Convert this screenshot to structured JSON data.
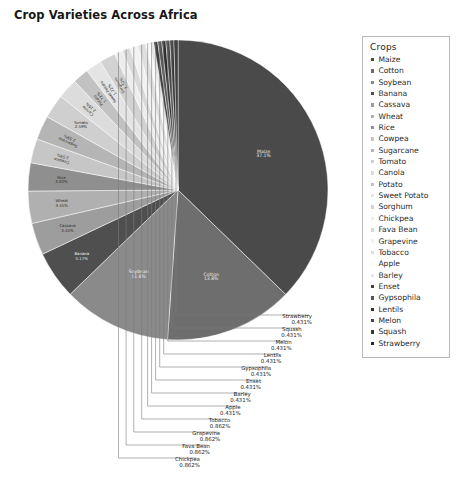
{
  "chart_title": "Crop Varieties Across Africa",
  "legend": {
    "title": "Crops",
    "items": [
      {
        "label": "Maize",
        "color": "#4a4a4a"
      },
      {
        "label": "Cotton",
        "color": "#6e6e6e"
      },
      {
        "label": "Soybean",
        "color": "#8a8a8a"
      },
      {
        "label": "Banana",
        "color": "#4f4f4f"
      },
      {
        "label": "Cassava",
        "color": "#9d9d9d"
      },
      {
        "label": "Wheat",
        "color": "#b0b0b0"
      },
      {
        "label": "Rice",
        "color": "#8f8f8f"
      },
      {
        "label": "Cowpea",
        "color": "#c6c6c6"
      },
      {
        "label": "Sugarcane",
        "color": "#b5b5b5"
      },
      {
        "label": "Tomato",
        "color": "#cfcfcf"
      },
      {
        "label": "Canola",
        "color": "#dcdcdc"
      },
      {
        "label": "Potato",
        "color": "#c2c2c2"
      },
      {
        "label": "Sweet Potato",
        "color": "#e4e4e4"
      },
      {
        "label": "Sorghum",
        "color": "#d2d2d2"
      },
      {
        "label": "Chickpea",
        "color": "#ededed"
      },
      {
        "label": "Fava Bean",
        "color": "#dadada"
      },
      {
        "label": "Grapevine",
        "color": "#f2f2f2"
      },
      {
        "label": "Tobacco",
        "color": "#e0e0e0"
      },
      {
        "label": "Apple",
        "color": "#fafafa"
      },
      {
        "label": "Barley",
        "color": "#e8e8e8"
      },
      {
        "label": "Enset",
        "color": "#3f3f3f"
      },
      {
        "label": "Gypsophila",
        "color": "#565656"
      },
      {
        "label": "Lentils",
        "color": "#2e2e2e"
      },
      {
        "label": "Melon",
        "color": "#474747"
      },
      {
        "label": "Squash",
        "color": "#383838"
      },
      {
        "label": "Strawberry",
        "color": "#282828"
      }
    ]
  },
  "chart_data": {
    "type": "pie",
    "title": "Crop Varieties Across Africa",
    "legend_position": "right",
    "legend_title": "Crops",
    "units": "percent",
    "start_angle_deg": 0,
    "direction": "clockwise",
    "categories": [
      "Maize",
      "Cotton",
      "Soybean",
      "Banana",
      "Cassava",
      "Wheat",
      "Rice",
      "Cowpea",
      "Sugarcane",
      "Tomato",
      "Canola",
      "Potato",
      "Sweet Potato",
      "Sorghum",
      "Chickpea",
      "Fava Bean",
      "Grapevine",
      "Tobacco",
      "Apple",
      "Barley",
      "Enset",
      "Gypsophila",
      "Lentils",
      "Melon",
      "Squash",
      "Strawberry"
    ],
    "values": [
      37.1,
      13.8,
      11.6,
      5.17,
      3.45,
      3.45,
      3.02,
      2.59,
      2.59,
      2.59,
      2.16,
      1.72,
      1.72,
      1.72,
      0.862,
      0.862,
      0.862,
      0.862,
      0.431,
      0.431,
      0.431,
      0.431,
      0.431,
      0.431,
      0.431,
      0.431
    ],
    "slices": [
      {
        "name": "Maize",
        "value": 37.1,
        "label": "Maize",
        "pct_label": "37.1%",
        "color": "#4a4a4a",
        "label_mode": "inside"
      },
      {
        "name": "Cotton",
        "value": 13.8,
        "label": "Cotton",
        "pct_label": "13.8%",
        "color": "#6e6e6e",
        "label_mode": "inside"
      },
      {
        "name": "Soybean",
        "value": 11.6,
        "label": "Soybean",
        "pct_label": "11.6%",
        "color": "#8a8a8a",
        "label_mode": "inside"
      },
      {
        "name": "Banana",
        "value": 5.17,
        "label": "Banana",
        "pct_label": "5.17%",
        "color": "#4f4f4f",
        "label_mode": "inside"
      },
      {
        "name": "Cassava",
        "value": 3.45,
        "label": "Cassava",
        "pct_label": "3.45%",
        "color": "#9d9d9d",
        "label_mode": "inside"
      },
      {
        "name": "Wheat",
        "value": 3.45,
        "label": "Wheat",
        "pct_label": "3.45%",
        "color": "#b0b0b0",
        "label_mode": "inside"
      },
      {
        "name": "Rice",
        "value": 3.02,
        "label": "Rice",
        "pct_label": "3.02%",
        "color": "#8f8f8f",
        "label_mode": "inside"
      },
      {
        "name": "Cowpea",
        "value": 2.59,
        "label": "Cowpea",
        "pct_label": "2.59%",
        "color": "#c6c6c6",
        "label_mode": "inside-rotated"
      },
      {
        "name": "Sugarcane",
        "value": 2.59,
        "label": "Sugarcane",
        "pct_label": "2.59%",
        "color": "#b5b5b5",
        "label_mode": "inside-rotated"
      },
      {
        "name": "Tomato",
        "value": 2.59,
        "label": "Tomato",
        "pct_label": "2.59%",
        "color": "#cfcfcf",
        "label_mode": "inside"
      },
      {
        "name": "Canola",
        "value": 2.16,
        "label": "Canola",
        "pct_label": "2.16%",
        "color": "#dcdcdc",
        "label_mode": "inside-rotated"
      },
      {
        "name": "Potato",
        "value": 1.72,
        "label": "Potato",
        "pct_label": "1.72%",
        "color": "#c2c2c2",
        "label_mode": "inside-rotated"
      },
      {
        "name": "Sweet Potato",
        "value": 1.72,
        "label": "Sweet Potato",
        "pct_label": "1.72%",
        "color": "#e4e4e4",
        "label_mode": "inside-rotated"
      },
      {
        "name": "Sorghum",
        "value": 1.72,
        "label": "Sorghum",
        "pct_label": "1.72%",
        "color": "#d2d2d2",
        "label_mode": "inside-rotated"
      },
      {
        "name": "Chickpea",
        "value": 0.862,
        "label": "Chickpea",
        "pct_label": "0.862%",
        "color": "#ededed",
        "label_mode": "callout"
      },
      {
        "name": "Fava Bean",
        "value": 0.862,
        "label": "Fava Bean",
        "pct_label": "0.862%",
        "color": "#dadada",
        "label_mode": "callout"
      },
      {
        "name": "Grapevine",
        "value": 0.862,
        "label": "Grapevine",
        "pct_label": "0.862%",
        "color": "#f2f2f2",
        "label_mode": "callout"
      },
      {
        "name": "Tobacco",
        "value": 0.862,
        "label": "Tobacco",
        "pct_label": "0.862%",
        "color": "#e0e0e0",
        "label_mode": "callout"
      },
      {
        "name": "Apple",
        "value": 0.431,
        "label": "Apple",
        "pct_label": "0.431%",
        "color": "#fafafa",
        "label_mode": "callout"
      },
      {
        "name": "Barley",
        "value": 0.431,
        "label": "Barley",
        "pct_label": "0.431%",
        "color": "#e8e8e8",
        "label_mode": "callout"
      },
      {
        "name": "Enset",
        "value": 0.431,
        "label": "Enset",
        "pct_label": "0.431%",
        "color": "#3f3f3f",
        "label_mode": "callout"
      },
      {
        "name": "Gypsophila",
        "value": 0.431,
        "label": "Gypsophila",
        "pct_label": "0.431%",
        "color": "#565656",
        "label_mode": "callout"
      },
      {
        "name": "Lentils",
        "value": 0.431,
        "label": "Lentils",
        "pct_label": "0.431%",
        "color": "#2e2e2e",
        "label_mode": "callout"
      },
      {
        "name": "Melon",
        "value": 0.431,
        "label": "Melon",
        "pct_label": "0.431%",
        "color": "#474747",
        "label_mode": "callout"
      },
      {
        "name": "Squash",
        "value": 0.431,
        "label": "Squash",
        "pct_label": "0.431%",
        "color": "#383838",
        "label_mode": "callout"
      },
      {
        "name": "Strawberry",
        "value": 0.431,
        "label": "Strawberry",
        "pct_label": "0.431%",
        "color": "#282828",
        "label_mode": "callout"
      }
    ]
  }
}
